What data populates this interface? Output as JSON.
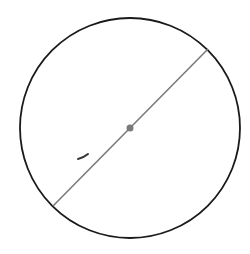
{
  "diagram": {
    "type": "circle-with-diameter",
    "canvas": {
      "width": 250,
      "height": 254,
      "background": "#ffffff"
    },
    "circle": {
      "cx": 130,
      "cy": 128,
      "r": 110,
      "stroke": "#1a1a1a",
      "stroke_width": 1.8
    },
    "diameter": {
      "x1": 208,
      "y1": 49,
      "x2": 53,
      "y2": 206,
      "stroke": "#7a7a7a",
      "stroke_width": 1.6
    },
    "center_point": {
      "cx": 130,
      "cy": 128,
      "r": 3.5,
      "fill": "#7a7a7a"
    },
    "mark": {
      "path": "M78 159 Q83 158 88 154",
      "stroke": "#333333",
      "stroke_width": 2
    }
  }
}
